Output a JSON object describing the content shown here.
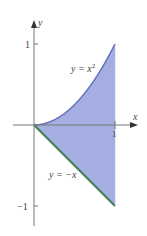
{
  "figure": {
    "axes": {
      "x_label": "x",
      "y_label": "y",
      "x_ticks": [
        {
          "value": 1,
          "label": "1"
        }
      ],
      "y_ticks": [
        {
          "value": 1,
          "label": "1"
        },
        {
          "value": -1,
          "label": "−1"
        }
      ]
    },
    "curves": [
      {
        "name": "upper",
        "equation_label_prefix": "y = x",
        "equation_label_sup": "2",
        "color": "#6670b8"
      },
      {
        "name": "lower",
        "equation_label": "y = −x",
        "color": "#3d7a4a"
      }
    ],
    "region": {
      "description": "Region between y = x^2 and y = -x for 0 <= x <= 1",
      "fill_color": "#a5aee0",
      "x_range": [
        0,
        1
      ]
    },
    "colors": {
      "axis": "#777777",
      "fill": "#a5aee0",
      "upper_curve": "#6670b8",
      "lower_line": "#3d7a4a"
    }
  }
}
